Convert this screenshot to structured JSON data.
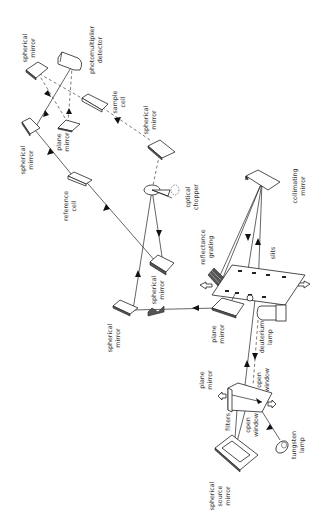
{
  "diagram": {
    "title": "",
    "background": "#ffffff",
    "line_color": "#222222",
    "labels": {
      "spherical_mirror_top": [
        "spherical",
        "mirror"
      ],
      "photomultiplier_detector": [
        "photomultiplier",
        "detector"
      ],
      "sample_cell": [
        "sample",
        "cell"
      ],
      "plane_mirror_upper": [
        "plane",
        "mirror"
      ],
      "spherical_mirror_left": [
        "spherical",
        "mirror"
      ],
      "spherical_mirror_right": [
        "spherical",
        "mirror"
      ],
      "reference_cell": [
        "reference",
        "cell"
      ],
      "optical_chopper": [
        "optical",
        "chopper"
      ],
      "collimating_mirror": [
        "collimating",
        "mirror"
      ],
      "spherical_mirror_mid": [
        "spherical",
        "mirror"
      ],
      "reflectance_grating": [
        "reflectance",
        "grating"
      ],
      "slits": [
        "slits"
      ],
      "spherical_mirror_lower": [
        "spherical",
        "mirror"
      ],
      "plane_mirror_mid": [
        "plane",
        "mirror"
      ],
      "deuterium_lamp": [
        "deuterium",
        "lamp"
      ],
      "plane_mirror_lower": [
        "plane",
        "mirror"
      ],
      "open_window_upper": [
        "open",
        "window"
      ],
      "filters": [
        "filters"
      ],
      "open_window_lower": [
        "open",
        "window"
      ],
      "tungsten_lamp": [
        "tungsten",
        "lamp"
      ],
      "spherical_source_mirror": [
        "spherical",
        "source",
        "mirror"
      ]
    },
    "legend": {
      "solid_line": "reference beam path",
      "dashed_line": "sample beam path"
    },
    "nodes": [
      {
        "id": "spherical_source_mirror",
        "type": "mirror"
      },
      {
        "id": "tungsten_lamp",
        "type": "source"
      },
      {
        "id": "filters",
        "type": "filter"
      },
      {
        "id": "plane_mirror_lower",
        "type": "mirror"
      },
      {
        "id": "deuterium_lamp",
        "type": "source"
      },
      {
        "id": "plane_mirror_mid",
        "type": "mirror"
      },
      {
        "id": "slits",
        "type": "aperture"
      },
      {
        "id": "collimating_mirror",
        "type": "mirror"
      },
      {
        "id": "reflectance_grating",
        "type": "grating"
      },
      {
        "id": "spherical_mirror_lower",
        "type": "mirror"
      },
      {
        "id": "spherical_mirror_mid",
        "type": "mirror"
      },
      {
        "id": "optical_chopper",
        "type": "chopper"
      },
      {
        "id": "reference_cell",
        "type": "cell"
      },
      {
        "id": "spherical_mirror_right",
        "type": "mirror"
      },
      {
        "id": "sample_cell",
        "type": "cell"
      },
      {
        "id": "spherical_mirror_left",
        "type": "mirror"
      },
      {
        "id": "plane_mirror_upper",
        "type": "mirror"
      },
      {
        "id": "spherical_mirror_top",
        "type": "mirror"
      },
      {
        "id": "photomultiplier_detector",
        "type": "detector"
      }
    ],
    "edges": [
      {
        "from": "tungsten_lamp",
        "to": "plane_mirror_lower",
        "style": "solid"
      },
      {
        "from": "spherical_source_mirror",
        "to": "plane_mirror_lower",
        "style": "solid"
      },
      {
        "from": "deuterium_lamp",
        "to": "plane_mirror_lower",
        "style": "dashed"
      },
      {
        "from": "plane_mirror_lower",
        "to": "slits",
        "style": "solid"
      },
      {
        "from": "slits",
        "to": "collimating_mirror",
        "style": "solid"
      },
      {
        "from": "collimating_mirror",
        "to": "reflectance_grating",
        "style": "solid"
      },
      {
        "from": "plane_mirror_mid",
        "to": "spherical_mirror_lower",
        "style": "solid"
      },
      {
        "from": "spherical_mirror_lower",
        "to": "optical_chopper",
        "style": "solid"
      },
      {
        "from": "optical_chopper",
        "to": "spherical_mirror_mid",
        "style": "solid"
      },
      {
        "from": "spherical_mirror_mid",
        "to": "reference_cell",
        "style": "solid"
      },
      {
        "from": "reference_cell",
        "to": "spherical_mirror_left",
        "style": "solid"
      },
      {
        "from": "spherical_mirror_left",
        "to": "photomultiplier_detector",
        "style": "solid"
      },
      {
        "from": "optical_chopper",
        "to": "spherical_mirror_right",
        "style": "dashed"
      },
      {
        "from": "spherical_mirror_right",
        "to": "sample_cell",
        "style": "dashed"
      },
      {
        "from": "sample_cell",
        "to": "spherical_mirror_top",
        "style": "dashed"
      },
      {
        "from": "spherical_mirror_top",
        "to": "plane_mirror_upper",
        "style": "dashed"
      },
      {
        "from": "plane_mirror_upper",
        "to": "photomultiplier_detector",
        "style": "dashed"
      }
    ]
  }
}
